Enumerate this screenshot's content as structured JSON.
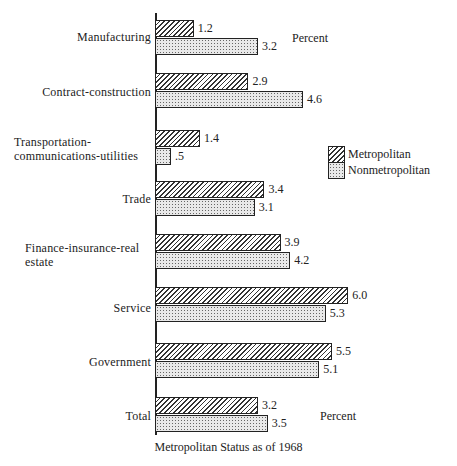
{
  "chart_data": {
    "type": "bar",
    "orientation": "horizontal",
    "title": "",
    "xlabel": "Metropolitan Status as of 1968",
    "ylabel": "",
    "unit_label": "Percent",
    "categories": [
      "Manufacturing",
      "Contract-construction",
      "Transportation-communications-utilities",
      "Trade",
      "Finance-insurance-real estate",
      "Service",
      "Government",
      "Total"
    ],
    "series": [
      {
        "name": "Metropolitan",
        "pattern": "diagonal-hatch",
        "values": [
          1.2,
          2.9,
          1.4,
          3.4,
          3.9,
          6.0,
          5.5,
          3.2
        ]
      },
      {
        "name": "Nonmetropolitan",
        "pattern": "stipple",
        "values": [
          3.2,
          4.6,
          0.5,
          3.1,
          4.2,
          5.3,
          5.1,
          3.5
        ]
      }
    ],
    "value_labels": {
      "Metropolitan": [
        "1.2",
        "2.9",
        "1.4",
        "3.4",
        "3.9",
        "6.0",
        "5.5",
        "3.2"
      ],
      "Nonmetropolitan": [
        "3.2",
        "4.6",
        ".5",
        "3.1",
        "4.2",
        "5.3",
        "5.1",
        "3.5"
      ]
    },
    "grid": false,
    "legend_position": "right-middle",
    "xlim": [
      0,
      6.5
    ]
  },
  "labels": {
    "cat0": "Manufacturing",
    "cat1": "Contract-construction",
    "cat2a": "Transportation-",
    "cat2b": "communications-utilities",
    "cat3": "Trade",
    "cat4a": "Finance-insurance-real",
    "cat4b": "estate",
    "cat5": "Service",
    "cat6": "Government",
    "cat7": "Total",
    "percent_top": "Percent",
    "percent_bottom": "Percent",
    "legend_metro": "Metropolitan",
    "legend_nonmetro": "Nonmetropolitan",
    "caption": "Metropolitan Status as of 1968"
  }
}
